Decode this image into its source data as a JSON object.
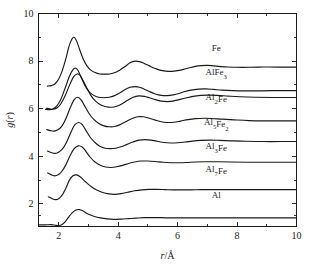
{
  "chart_data": {
    "type": "line",
    "title": "",
    "subtitle": "",
    "xlabel": "r/Å",
    "ylabel": "g(r)",
    "xlim": [
      1.32,
      10.0
    ],
    "ylim": [
      1.05,
      10.0
    ],
    "grid": false,
    "legend_position": "inline-right",
    "x_ticks_major": [
      2,
      4,
      6,
      8,
      10
    ],
    "x_ticks_major_labels": [
      "2",
      "4",
      "6",
      "8",
      "10"
    ],
    "x_ticks_minor": [
      3,
      5,
      7,
      9
    ],
    "y_ticks_major": [
      2,
      4,
      6,
      8,
      10
    ],
    "y_ticks_major_labels": [
      "2",
      "4",
      "6",
      "8",
      "10"
    ],
    "y_ticks_minor": [
      3,
      5,
      7,
      9
    ],
    "note": "Radial distribution functions g(r) of seven phases, curves vertically offset by a constant for clarity.",
    "series": [
      {
        "name": "Fe",
        "label_html": "Fe",
        "label_plain": "Fe",
        "offset": 6.75,
        "label_x": 7.3,
        "label_y": 8.42,
        "x": [
          1.62,
          1.75,
          1.88,
          2.0,
          2.12,
          2.24,
          2.34,
          2.44,
          2.52,
          2.6,
          2.7,
          2.82,
          2.95,
          3.08,
          3.22,
          3.38,
          3.55,
          3.72,
          3.9,
          4.05,
          4.22,
          4.4,
          4.58,
          4.72,
          4.88,
          5.05,
          5.22,
          5.4,
          5.6,
          5.8,
          6.0,
          6.2,
          6.4,
          6.6,
          6.8,
          7.0,
          7.2,
          7.45,
          7.7,
          8.0,
          8.4,
          8.9,
          9.4,
          10.0
        ],
        "y": [
          6.95,
          6.97,
          7.05,
          7.25,
          7.6,
          8.1,
          8.6,
          8.92,
          9.0,
          8.85,
          8.5,
          8.1,
          7.8,
          7.62,
          7.52,
          7.46,
          7.45,
          7.46,
          7.52,
          7.62,
          7.76,
          7.93,
          8.0,
          7.98,
          7.9,
          7.8,
          7.7,
          7.62,
          7.58,
          7.57,
          7.6,
          7.65,
          7.72,
          7.78,
          7.81,
          7.82,
          7.8,
          7.77,
          7.75,
          7.74,
          7.74,
          7.75,
          7.75,
          7.75
        ]
      },
      {
        "name": "AlFe3",
        "label_html": "AlFe<sub>3</sub>",
        "label_plain": "AlFe3",
        "offset": 5.8,
        "label_x": 7.3,
        "label_y": 7.4,
        "x": [
          1.56,
          1.68,
          1.8,
          1.94,
          2.08,
          2.22,
          2.36,
          2.48,
          2.58,
          2.66,
          2.76,
          2.88,
          3.02,
          3.18,
          3.34,
          3.52,
          3.7,
          3.88,
          4.05,
          4.22,
          4.4,
          4.58,
          4.72,
          4.88,
          5.05,
          5.25,
          5.45,
          5.65,
          5.85,
          6.05,
          6.25,
          6.45,
          6.7,
          6.95,
          7.2,
          7.5,
          7.85,
          8.3,
          8.8,
          9.4,
          10.0
        ],
        "y": [
          5.97,
          5.96,
          5.99,
          6.12,
          6.42,
          6.88,
          7.36,
          7.64,
          7.7,
          7.58,
          7.3,
          6.98,
          6.72,
          6.56,
          6.48,
          6.46,
          6.48,
          6.55,
          6.66,
          6.8,
          6.9,
          6.93,
          6.9,
          6.82,
          6.72,
          6.62,
          6.56,
          6.55,
          6.58,
          6.64,
          6.72,
          6.78,
          6.82,
          6.83,
          6.81,
          6.78,
          6.76,
          6.75,
          6.75,
          6.76,
          6.76
        ]
      },
      {
        "name": "Al2Fe",
        "label_html": "Al<sub>2</sub>Fe",
        "label_plain": "Al2Fe",
        "offset": 4.75,
        "label_x": 7.3,
        "label_y": 6.35,
        "x": [
          1.58,
          1.7,
          1.82,
          1.95,
          2.08,
          2.22,
          2.36,
          2.5,
          2.62,
          2.72,
          2.82,
          2.95,
          3.08,
          3.24,
          3.42,
          3.6,
          3.78,
          3.95,
          4.12,
          4.3,
          4.5,
          4.7,
          4.88,
          5.05,
          5.25,
          5.45,
          5.65,
          5.85,
          6.05,
          6.28,
          6.52,
          6.78,
          7.05,
          7.35,
          7.7,
          8.1,
          8.6,
          9.2,
          10.0
        ],
        "y": [
          6.02,
          5.99,
          5.98,
          6.04,
          6.22,
          6.55,
          6.98,
          7.34,
          7.46,
          7.4,
          7.18,
          6.86,
          6.56,
          6.32,
          6.16,
          6.08,
          6.06,
          6.1,
          6.2,
          6.34,
          6.48,
          6.54,
          6.52,
          6.46,
          6.38,
          6.32,
          6.3,
          6.32,
          6.38,
          6.45,
          6.52,
          6.56,
          6.57,
          6.56,
          6.53,
          6.5,
          6.48,
          6.47,
          6.47
        ]
      },
      {
        "name": "Al5Fe2",
        "label_html": "Al<sub>5</sub>Fe<sub>2</sub>",
        "label_plain": "Al5Fe2",
        "offset": 3.7,
        "label_x": 7.3,
        "label_y": 5.32,
        "x": [
          1.6,
          1.72,
          1.84,
          1.96,
          2.1,
          2.24,
          2.38,
          2.52,
          2.64,
          2.76,
          2.88,
          3.02,
          3.18,
          3.35,
          3.52,
          3.7,
          3.88,
          4.05,
          4.25,
          4.45,
          4.65,
          4.85,
          5.05,
          5.25,
          5.45,
          5.65,
          5.88,
          6.1,
          6.35,
          6.6,
          6.88,
          7.15,
          7.5,
          7.9,
          8.4,
          9.0,
          9.5,
          10.0
        ],
        "y": [
          5.12,
          5.08,
          5.06,
          5.1,
          5.26,
          5.58,
          6.02,
          6.38,
          6.48,
          6.36,
          6.1,
          5.8,
          5.55,
          5.38,
          5.28,
          5.24,
          5.25,
          5.32,
          5.45,
          5.58,
          5.66,
          5.66,
          5.6,
          5.52,
          5.45,
          5.42,
          5.43,
          5.48,
          5.54,
          5.58,
          5.6,
          5.59,
          5.56,
          5.53,
          5.5,
          5.49,
          5.49,
          5.49
        ]
      },
      {
        "name": "Al3Fe",
        "label_html": "Al<sub>3</sub>Fe",
        "label_plain": "Al3Fe",
        "offset": 2.75,
        "label_x": 7.3,
        "label_y": 4.32,
        "x": [
          1.62,
          1.74,
          1.86,
          1.98,
          2.12,
          2.26,
          2.4,
          2.54,
          2.68,
          2.8,
          2.92,
          3.06,
          3.22,
          3.38,
          3.56,
          3.74,
          3.92,
          4.1,
          4.3,
          4.5,
          4.7,
          4.9,
          5.1,
          5.32,
          5.54,
          5.76,
          6.0,
          6.25,
          6.5,
          6.78,
          7.08,
          7.4,
          7.8,
          8.3,
          8.9,
          9.5,
          10.0
        ],
        "y": [
          4.22,
          4.16,
          4.12,
          4.16,
          4.3,
          4.58,
          4.98,
          5.32,
          5.42,
          5.32,
          5.08,
          4.8,
          4.58,
          4.42,
          4.34,
          4.32,
          4.34,
          4.4,
          4.5,
          4.6,
          4.68,
          4.7,
          4.68,
          4.63,
          4.58,
          4.56,
          4.57,
          4.6,
          4.64,
          4.67,
          4.68,
          4.67,
          4.65,
          4.63,
          4.62,
          4.62,
          4.62
        ]
      },
      {
        "name": "Al7Fe",
        "label_html": "Al<sub>7</sub>Fe",
        "label_plain": "Al7Fe",
        "offset": 1.72,
        "label_x": 7.3,
        "label_y": 3.32,
        "x": [
          1.63,
          1.75,
          1.86,
          1.98,
          2.1,
          2.24,
          2.38,
          2.52,
          2.66,
          2.8,
          2.92,
          3.06,
          3.22,
          3.4,
          3.58,
          3.76,
          3.95,
          4.15,
          4.35,
          4.55,
          4.78,
          5.0,
          5.25,
          5.5,
          5.75,
          6.0,
          6.3,
          6.6,
          6.95,
          7.35,
          7.8,
          8.35,
          9.0,
          9.6,
          10.0
        ],
        "y": [
          3.3,
          3.22,
          3.18,
          3.22,
          3.36,
          3.64,
          4.02,
          4.32,
          4.44,
          4.38,
          4.2,
          3.96,
          3.76,
          3.62,
          3.55,
          3.53,
          3.56,
          3.62,
          3.7,
          3.76,
          3.8,
          3.8,
          3.78,
          3.75,
          3.73,
          3.73,
          3.74,
          3.76,
          3.77,
          3.77,
          3.76,
          3.75,
          3.75,
          3.75,
          3.75
        ]
      },
      {
        "name": "Al",
        "label_html": "Al",
        "label_plain": "Al",
        "offset": 0.6,
        "label_x": 7.3,
        "label_y": 2.25,
        "x": [
          1.65,
          1.78,
          1.9,
          2.0,
          2.12,
          2.24,
          2.36,
          2.48,
          2.6,
          2.72,
          2.84,
          2.96,
          3.1,
          3.28,
          3.48,
          3.68,
          3.88,
          4.1,
          4.32,
          4.55,
          4.8,
          5.05,
          5.3,
          5.58,
          5.85,
          6.15,
          6.45,
          6.8,
          7.2,
          7.65,
          8.2,
          8.8,
          9.4,
          10.0
        ],
        "y": [
          2.3,
          2.22,
          2.18,
          2.22,
          2.38,
          2.66,
          3.0,
          3.18,
          3.22,
          3.14,
          3.0,
          2.86,
          2.72,
          2.58,
          2.48,
          2.42,
          2.4,
          2.43,
          2.49,
          2.55,
          2.59,
          2.61,
          2.61,
          2.6,
          2.59,
          2.59,
          2.59,
          2.6,
          2.6,
          2.6,
          2.6,
          2.6,
          2.6,
          2.6
        ]
      }
    ],
    "baseline_curve": {
      "name": "Al-bottom",
      "x": [
        1.35,
        1.55,
        1.75,
        1.9,
        2.0,
        2.1,
        2.2,
        2.32,
        2.45,
        2.58,
        2.7,
        2.82,
        2.92,
        3.05,
        3.2,
        3.4,
        3.62,
        3.85,
        4.1,
        4.35,
        4.6,
        4.88,
        5.15,
        5.45,
        5.75,
        6.05,
        6.4,
        6.8,
        7.25,
        7.8,
        8.45,
        9.2,
        10.0
      ],
      "y": [
        1.12,
        1.12,
        1.13,
        1.1,
        1.09,
        1.12,
        1.22,
        1.42,
        1.62,
        1.74,
        1.76,
        1.7,
        1.62,
        1.54,
        1.47,
        1.41,
        1.37,
        1.35,
        1.36,
        1.38,
        1.4,
        1.42,
        1.42,
        1.42,
        1.41,
        1.41,
        1.41,
        1.41,
        1.41,
        1.41,
        1.41,
        1.41,
        1.41
      ]
    },
    "colors": {
      "curve": "#1a1a1a",
      "axis": "#1a1a1a",
      "background": "#ffffff"
    }
  }
}
